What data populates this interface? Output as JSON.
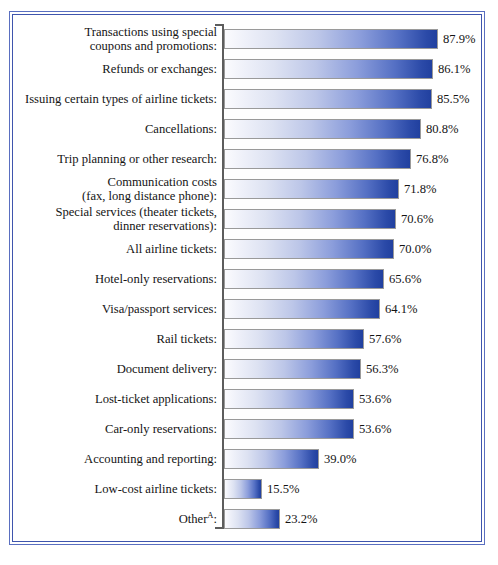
{
  "chart_data": {
    "type": "bar",
    "orientation": "horizontal",
    "title": "",
    "subtitle": "",
    "xlabel": "",
    "ylabel": "",
    "xlim": [
      0,
      87.9
    ],
    "grid": false,
    "legend": null,
    "value_suffix": "%",
    "footnote_marker": "A",
    "categories": [
      "Transactions using special coupons and promotions:",
      "Refunds or exchanges:",
      "Issuing certain types of airline tickets:",
      "Cancellations:",
      "Trip planning or other research:",
      "Communication costs (fax, long distance phone):",
      "Special services (theater tickets, dinner reservations):",
      "All airline tickets:",
      "Hotel-only reservations:",
      "Visa/passport services:",
      "Rail tickets:",
      "Document delivery:",
      "Lost-ticket applications:",
      "Car-only reservations:",
      "Accounting and reporting:",
      "Low-cost airline tickets:",
      "Other:"
    ],
    "values": [
      87.9,
      86.1,
      85.5,
      80.8,
      76.8,
      71.8,
      70.6,
      70.0,
      65.6,
      64.1,
      57.6,
      56.3,
      53.6,
      53.6,
      39.0,
      15.5,
      23.2
    ]
  },
  "colors": {
    "frame_outer": "#5a6fc0",
    "frame_inner": "#3f55ad",
    "bar_start": "#fbfbfe",
    "bar_end": "#21409f",
    "bar_outline": "#9a9a9a",
    "axis": "#5d5d5d",
    "text": "#141414",
    "background": "#ffffff"
  },
  "rows": [
    {
      "label_lines": [
        "Transactions using special",
        "coupons and promotions:"
      ],
      "value": 87.9,
      "value_label": "87.9%",
      "superscript": ""
    },
    {
      "label_lines": [
        "Refunds or exchanges:"
      ],
      "value": 86.1,
      "value_label": "86.1%",
      "superscript": ""
    },
    {
      "label_lines": [
        "Issuing certain types of airline tickets:"
      ],
      "value": 85.5,
      "value_label": "85.5%",
      "superscript": ""
    },
    {
      "label_lines": [
        "Cancellations:"
      ],
      "value": 80.8,
      "value_label": "80.8%",
      "superscript": ""
    },
    {
      "label_lines": [
        "Trip planning or other research:"
      ],
      "value": 76.8,
      "value_label": "76.8%",
      "superscript": ""
    },
    {
      "label_lines": [
        "Communication costs",
        "(fax, long distance phone):"
      ],
      "value": 71.8,
      "value_label": "71.8%",
      "superscript": ""
    },
    {
      "label_lines": [
        "Special services (theater tickets,",
        "dinner reservations):"
      ],
      "value": 70.6,
      "value_label": "70.6%",
      "superscript": ""
    },
    {
      "label_lines": [
        "All airline tickets:"
      ],
      "value": 70.0,
      "value_label": "70.0%",
      "superscript": ""
    },
    {
      "label_lines": [
        "Hotel-only reservations:"
      ],
      "value": 65.6,
      "value_label": "65.6%",
      "superscript": ""
    },
    {
      "label_lines": [
        "Visa/passport services:"
      ],
      "value": 64.1,
      "value_label": "64.1%",
      "superscript": ""
    },
    {
      "label_lines": [
        "Rail tickets:"
      ],
      "value": 57.6,
      "value_label": "57.6%",
      "superscript": ""
    },
    {
      "label_lines": [
        "Document delivery:"
      ],
      "value": 56.3,
      "value_label": "56.3%",
      "superscript": ""
    },
    {
      "label_lines": [
        "Lost-ticket applications:"
      ],
      "value": 53.6,
      "value_label": "53.6%",
      "superscript": ""
    },
    {
      "label_lines": [
        "Car-only reservations:"
      ],
      "value": 53.6,
      "value_label": "53.6%",
      "superscript": ""
    },
    {
      "label_lines": [
        "Accounting and reporting:"
      ],
      "value": 39.0,
      "value_label": "39.0%",
      "superscript": ""
    },
    {
      "label_lines": [
        "Low-cost airline tickets:"
      ],
      "value": 15.5,
      "value_label": "15.5%",
      "superscript": ""
    },
    {
      "label_lines": [
        "Other:"
      ],
      "value": 23.2,
      "value_label": "23.2%",
      "superscript": "A"
    }
  ],
  "layout": {
    "axis_x": 222,
    "bar_origin_x": 224,
    "first_row_top": 24,
    "row_pitch": 30,
    "bar_height": 20,
    "px_per_percent": 2.432
  }
}
